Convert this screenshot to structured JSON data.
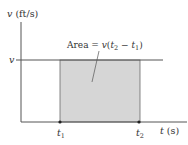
{
  "diagram": {
    "y_axis": {
      "label_var": "v",
      "label_unit": " (ft/s)"
    },
    "x_axis": {
      "label_var": "t",
      "label_unit": " (s)"
    },
    "v_level_label": "v",
    "area_label": {
      "prefix": "Area = ",
      "v": "v",
      "open": "(",
      "t2": "t",
      "sub2": "2",
      "minus": " − ",
      "t1": "t",
      "sub1": "1",
      "close": ")"
    },
    "t1_label": {
      "t": "t",
      "sub": "1"
    },
    "t2_label": {
      "t": "t",
      "sub": "2"
    },
    "colors": {
      "axis": "#555555",
      "shade": "#d6d6d6",
      "shade_edge": "#666666",
      "text": "#333333"
    }
  }
}
